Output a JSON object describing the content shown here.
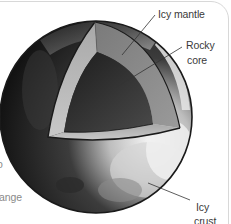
{
  "diagram": {
    "colors": {
      "background": "#ffffff",
      "outline": "#1a1a1a",
      "leader_line": "#333333",
      "crust_dark": "#141414",
      "crust_light": "#e8e8e8",
      "mantle": "#8a8a8a",
      "mantle_cut_face": "#b8b8b8",
      "core": "#2e2e2e",
      "label_text": "#3a3a3a"
    },
    "labels": {
      "icy_mantle": "Icy mantle",
      "rocky_core_line1": "Rocky",
      "rocky_core_line2": "core",
      "icy_crust_line1": "Icy",
      "icy_crust_line2": "crust"
    },
    "clipped_text": {
      "left_fragment_1": "o",
      "left_fragment_2": "ange"
    }
  }
}
